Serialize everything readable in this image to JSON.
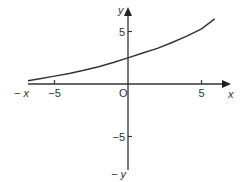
{
  "chart_data": {
    "type": "line",
    "title": "",
    "xlabel": "x",
    "ylabel": "y",
    "x_neg_label": "− x",
    "y_neg_label": "− y",
    "origin_label": "O",
    "xlim": [
      -6.8,
      6.5
    ],
    "ylim": [
      -8,
      7.5
    ],
    "x_ticks": [
      {
        "value": -5,
        "label": "−5"
      },
      {
        "value": 5,
        "label": "5"
      }
    ],
    "y_ticks": [
      {
        "value": 5,
        "label": "5"
      },
      {
        "value": -5,
        "label": "−5"
      }
    ],
    "grid": false,
    "legend": null,
    "series": [
      {
        "name": "curve",
        "color": "#333333",
        "x": [
          -6.8,
          -6,
          -5,
          -4,
          -3,
          -2,
          -1,
          0,
          1,
          2,
          3,
          4,
          5,
          5.9
        ],
        "y": [
          0.3,
          0.5,
          0.75,
          1.0,
          1.3,
          1.65,
          2.05,
          2.5,
          2.95,
          3.4,
          3.95,
          4.55,
          5.25,
          6.2
        ]
      }
    ]
  }
}
